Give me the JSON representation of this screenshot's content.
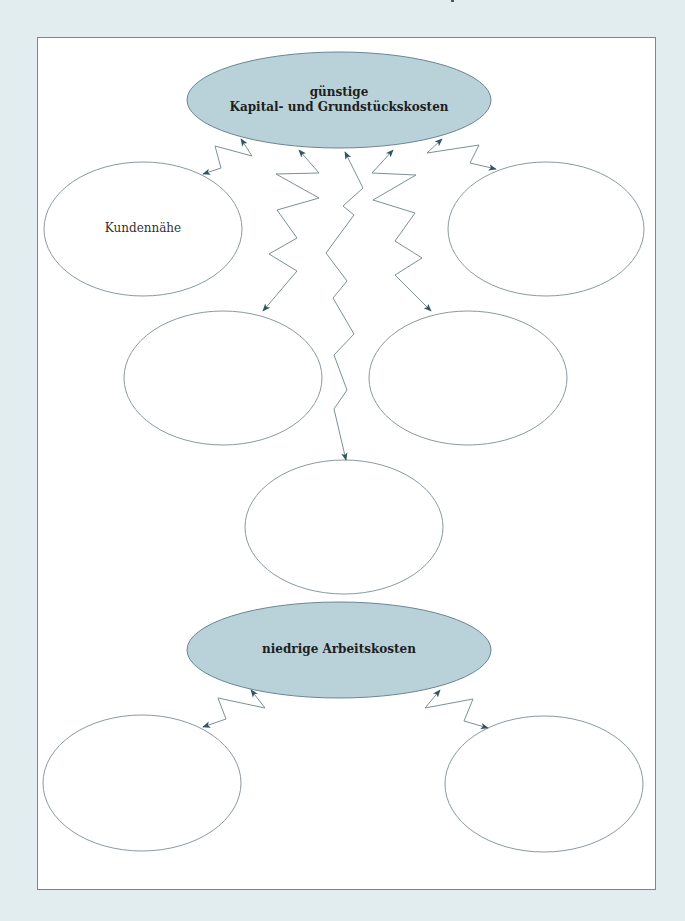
{
  "colors": {
    "background": "#e2edef",
    "frame_border": "#6f8b93",
    "primary_fill": "#b9d2da",
    "primary_stroke": "#6a8690",
    "outline_stroke": "#8a9aa0",
    "connector_stroke": "#7d9096",
    "arrowhead": "#2e5560"
  },
  "diagram": {
    "primary_nodes": [
      {
        "id": "capital-land-costs",
        "line1": "günstige",
        "line2": "Kapital- und Grundstückskosten"
      },
      {
        "id": "labor-costs",
        "line1": "niedrige Arbeitskosten"
      }
    ],
    "secondary_nodes": [
      {
        "id": "customer-proximity",
        "label": "Kundennähe"
      },
      {
        "id": "top-right",
        "label": ""
      },
      {
        "id": "middle-left",
        "label": ""
      },
      {
        "id": "middle-right",
        "label": ""
      },
      {
        "id": "center-bottom",
        "label": ""
      },
      {
        "id": "bottom-left",
        "label": ""
      },
      {
        "id": "bottom-right",
        "label": ""
      }
    ],
    "connectors": [
      {
        "from": "capital-land-costs",
        "to": "customer-proximity",
        "style": "zigzag-bidirectional"
      },
      {
        "from": "capital-land-costs",
        "to": "middle-left",
        "style": "zigzag-bidirectional"
      },
      {
        "from": "capital-land-costs",
        "to": "center-bottom",
        "style": "zigzag-bidirectional"
      },
      {
        "from": "capital-land-costs",
        "to": "middle-right",
        "style": "zigzag-bidirectional"
      },
      {
        "from": "capital-land-costs",
        "to": "top-right",
        "style": "zigzag-bidirectional"
      },
      {
        "from": "labor-costs",
        "to": "bottom-left",
        "style": "zigzag-bidirectional"
      },
      {
        "from": "labor-costs",
        "to": "bottom-right",
        "style": "zigzag-bidirectional"
      }
    ]
  }
}
